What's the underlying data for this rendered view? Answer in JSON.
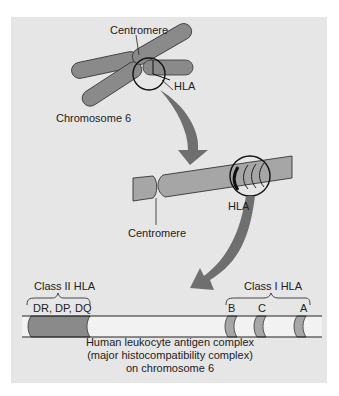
{
  "figure": {
    "chromosome": {
      "centromere_label": "Centromere",
      "hla_label": "HLA",
      "chromosome_label": "Chromosome 6"
    },
    "arm": {
      "centromere_label": "Centromere",
      "hla_label": "HLA"
    },
    "complex": {
      "class2_label": "Class II HLA",
      "class2_genes": "DR, DP, DQ",
      "class1_label": "Class I HLA",
      "class1_genes": [
        "B",
        "C",
        "A"
      ],
      "caption": [
        "Human leukocyte antigen complex",
        "(major histocompatibility complex)",
        "on chromosome 6"
      ]
    },
    "colors": {
      "background": "#e6e6e6",
      "chromosome_fill": "#8a8a8a",
      "arm_fill": "#a6a6a6",
      "arrow_fill": "#6f6f6f",
      "outline": "#111111"
    }
  }
}
